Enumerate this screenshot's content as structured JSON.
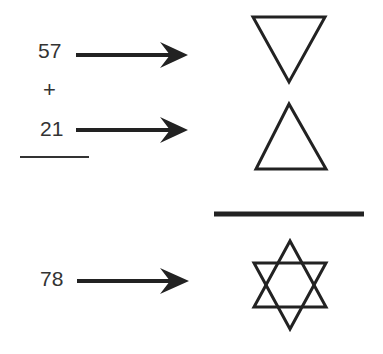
{
  "operands": [
    {
      "value": "57",
      "symbol": "downward-triangle"
    },
    {
      "value": "21",
      "symbol": "upward-triangle"
    }
  ],
  "operator": "+",
  "result": {
    "value": "78",
    "symbol": "six-pointed-star"
  },
  "colors": {
    "ink": "#222222",
    "text": "#333333"
  }
}
